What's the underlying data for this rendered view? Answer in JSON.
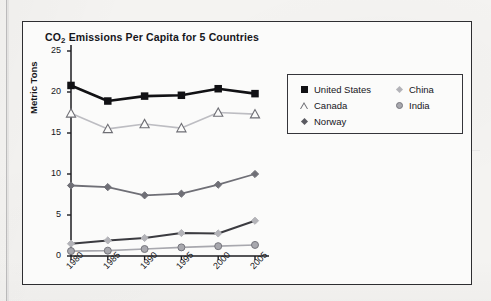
{
  "figure": {
    "title_main": "CO",
    "title_sub": "2",
    "title_rest": " Emissions Per Capita for 5 Countries"
  },
  "bleed_through_text": "",
  "legend": {
    "left_column": [
      {
        "label": "United States",
        "marker": "filled-square-marker",
        "color": "#111114"
      },
      {
        "label": "Canada",
        "marker": "open-triangle-marker",
        "color": "#6e6e74"
      },
      {
        "label": "Norway",
        "marker": "dark-diamond-marker",
        "color": "#5a5a61"
      }
    ],
    "right_column": [
      {
        "label": "China",
        "marker": "light-diamond-marker",
        "color": "#b3b3b8"
      },
      {
        "label": "India",
        "marker": "gray-circle-marker",
        "color": "#a8a8ae"
      }
    ]
  },
  "chart_data": {
    "type": "line",
    "title": "CO2 Emissions Per Capita for 5 Countries",
    "xlabel": "",
    "ylabel": "Metric Tons",
    "x": [
      "1980",
      "1985",
      "1990",
      "1995",
      "2000",
      "2005"
    ],
    "xtick_labels": [
      "1980",
      "1985",
      "1990",
      "1995",
      "2000",
      "2005"
    ],
    "ytick_labels": [
      "0",
      "5",
      "10",
      "15",
      "20",
      "25"
    ],
    "ylim": [
      0,
      25
    ],
    "ytick_step": 5,
    "grid": false,
    "legend_position": "right-upper-inside",
    "series": [
      {
        "name": "United States",
        "values": [
          20.8,
          18.9,
          19.5,
          19.6,
          20.4,
          19.8
        ],
        "color": "#111114",
        "marker": "square",
        "marker_fill": "#111114",
        "line_width": 2.6
      },
      {
        "name": "Canada",
        "values": [
          17.4,
          15.5,
          16.1,
          15.6,
          17.5,
          17.3
        ],
        "color": "#bdbdc2",
        "marker": "triangle-open",
        "marker_fill": "#fbfbfa",
        "line_width": 1.6
      },
      {
        "name": "Norway",
        "values": [
          8.6,
          8.4,
          7.4,
          7.6,
          8.7,
          10.0
        ],
        "color": "#6f6f76",
        "marker": "diamond",
        "marker_fill": "#6f6f76",
        "line_width": 1.8
      },
      {
        "name": "China",
        "values": [
          1.5,
          1.9,
          2.2,
          2.8,
          2.75,
          4.3
        ],
        "color": "#3b3b40",
        "marker": "diamond",
        "marker_fill": "#b3b3b8",
        "line_width": 2.0
      },
      {
        "name": "India",
        "values": [
          0.6,
          0.65,
          0.85,
          1.05,
          1.2,
          1.35
        ],
        "color": "#a8a8ae",
        "marker": "circle",
        "marker_fill": "#a8a8ae",
        "line_width": 1.6
      }
    ]
  }
}
